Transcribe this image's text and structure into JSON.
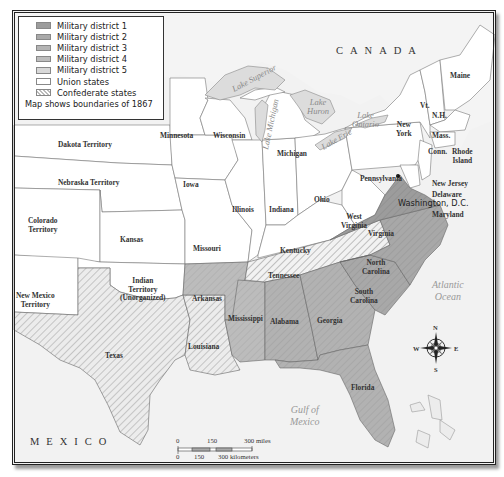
{
  "legend": {
    "items": [
      {
        "label": "Military district 1",
        "color": "#9c9c9c"
      },
      {
        "label": "Military district 2",
        "color": "#a9a9a9"
      },
      {
        "label": "Military district 3",
        "color": "#b4b4b4"
      },
      {
        "label": "Military district 4",
        "color": "#bdbdbd"
      },
      {
        "label": "Military district 5",
        "color": "#d8d8d8"
      },
      {
        "label": "Union states",
        "color": "#ffffff"
      },
      {
        "label": "Confederate states",
        "color": "hatched"
      }
    ],
    "note": "Map shows boundaries of 1867"
  },
  "countries": {
    "canada": "CANADA",
    "mexico": "MEXICO"
  },
  "water": {
    "lake_superior": "Lake Superior",
    "lake_michigan": "Lake Michigan",
    "lake_huron_1": "Lake",
    "lake_huron_2": "Huron",
    "lake_ontario_1": "Lake",
    "lake_ontario_2": "Ontario",
    "lake_erie": "Lake Erie",
    "atlantic_1": "Atlantic",
    "atlantic_2": "Ocean",
    "gulf_1": "Gulf of",
    "gulf_2": "Mexico"
  },
  "states": {
    "maine": "Maine",
    "vermont": "Vt.",
    "new_hampshire": "N.H.",
    "massachusetts": "Mass.",
    "connecticut": "Conn.",
    "rhode_island_1": "Rhode",
    "rhode_island_2": "Island",
    "new_york_1": "New",
    "new_york_2": "York",
    "new_jersey": "New Jersey",
    "delaware": "Delaware",
    "maryland": "Maryland",
    "washington_dc": "Washington, D.C.",
    "pennsylvania": "Pennsylvania",
    "minnesota": "Minnesota",
    "wisconsin": "Wisconsin",
    "michigan": "Michigan",
    "iowa": "Iowa",
    "illinois": "Illinois",
    "indiana": "Indiana",
    "ohio": "Ohio",
    "west_virginia_1": "West",
    "west_virginia_2": "Virginia",
    "kentucky": "Kentucky",
    "missouri": "Missouri",
    "kansas": "Kansas",
    "dakota": "Dakota Territory",
    "nebraska": "Nebraska Territory",
    "colorado_1": "Colorado",
    "colorado_2": "Territory",
    "new_mexico_1": "New Mexico",
    "new_mexico_2": "Territory",
    "indian_1": "Indian",
    "indian_2": "Territory",
    "indian_3": "(Unorganized)",
    "virginia": "Virginia",
    "north_carolina_1": "North",
    "north_carolina_2": "Carolina",
    "south_carolina_1": "South",
    "south_carolina_2": "Carolina",
    "tennessee": "Tennessee",
    "arkansas": "Arkansas",
    "mississippi": "Mississippi",
    "alabama": "Alabama",
    "georgia": "Georgia",
    "florida": "Florida",
    "louisiana": "Louisiana",
    "texas": "Texas"
  },
  "compass": {
    "n": "N",
    "s": "S",
    "e": "E",
    "w": "W"
  },
  "scale": {
    "miles_0": "0",
    "miles_150": "150",
    "miles_300": "300 miles",
    "km_0": "0",
    "km_150": "150",
    "km_300": "300 kilometers"
  }
}
